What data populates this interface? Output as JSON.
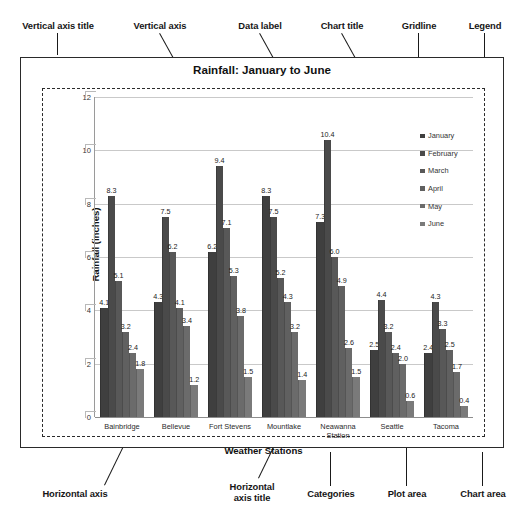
{
  "annotations": {
    "top": [
      {
        "label": "Vertical axis title",
        "x": 4,
        "y": 20,
        "w": 108,
        "leader": {
          "x": 58,
          "y": 33,
          "len": 22,
          "rot": 90
        }
      },
      {
        "label": "Vertical axis",
        "x": 118,
        "y": 20,
        "w": 84,
        "leader": {
          "x": 160,
          "y": 33,
          "len": 92,
          "rot": 61
        }
      },
      {
        "label": "Data label",
        "x": 224,
        "y": 20,
        "w": 72,
        "leader": {
          "x": 260,
          "y": 33,
          "len": 150,
          "rot": 61
        }
      },
      {
        "label": "Chart title",
        "x": 306,
        "y": 20,
        "w": 72,
        "leader": {
          "x": 342,
          "y": 33,
          "len": 46,
          "rot": 61
        }
      },
      {
        "label": "Gridline",
        "x": 388,
        "y": 20,
        "w": 62,
        "leader": {
          "x": 419,
          "y": 33,
          "len": 79,
          "rot": 90
        }
      },
      {
        "label": "Legend",
        "x": 454,
        "y": 20,
        "w": 62,
        "leader": {
          "x": 485,
          "y": 33,
          "len": 60,
          "rot": 90
        }
      }
    ],
    "bottom": [
      {
        "label": "Horizontal axis",
        "x": 20,
        "y": 488,
        "w": 110,
        "leader": {
          "x": 104,
          "y": 485,
          "len": 108,
          "rot": -64
        }
      },
      {
        "label": "Horizontal\naxis title",
        "x": 212,
        "y": 481,
        "w": 80,
        "leader": {
          "x": 258,
          "y": 478,
          "len": 52,
          "rot": -64
        }
      },
      {
        "label": "Categories",
        "x": 296,
        "y": 488,
        "w": 70,
        "leader": {
          "x": 331,
          "y": 452,
          "len": 34,
          "rot": 90
        }
      },
      {
        "label": "Plot area",
        "x": 374,
        "y": 488,
        "w": 66,
        "leader": {
          "x": 407,
          "y": 441,
          "len": 45,
          "rot": 90
        }
      },
      {
        "label": "Chart area",
        "x": 448,
        "y": 488,
        "w": 70,
        "leader": {
          "x": 483,
          "y": 452,
          "len": 34,
          "rot": 90
        }
      }
    ]
  },
  "chart": {
    "title": "Rainfall: January to June",
    "y_axis_title": "Rainfall (inches)",
    "x_axis_title": "Weather Stations",
    "y_ticks": [
      "12",
      "10",
      "8",
      "6",
      "4",
      "2",
      "0"
    ]
  },
  "legend": {
    "items": [
      {
        "label": "January",
        "color": "#3f3f3f"
      },
      {
        "label": "February",
        "color": "#4a4a4a"
      },
      {
        "label": "March",
        "color": "#585858"
      },
      {
        "label": "April",
        "color": "#606060"
      },
      {
        "label": "May",
        "color": "#6b6b6b"
      },
      {
        "label": "June",
        "color": "#7a7a7a"
      }
    ]
  },
  "chart_data": {
    "type": "bar",
    "title": "Rainfall: January to June",
    "xlabel": "Weather Stations",
    "ylabel": "Rainfall (inches)",
    "ylim": [
      0,
      12
    ],
    "yticks": [
      0,
      2,
      4,
      6,
      8,
      10,
      12
    ],
    "grid": true,
    "legend_position": "right",
    "categories": [
      "Bainbridge",
      "Bellevue",
      "Fort Stevens",
      "Mountlake",
      "Neawanna Station",
      "Seattle",
      "Tacoma"
    ],
    "series": [
      {
        "name": "January",
        "color": "#3f3f3f",
        "values": [
          4.1,
          4.3,
          6.2,
          8.3,
          7.3,
          2.5,
          2.4
        ]
      },
      {
        "name": "February",
        "color": "#4a4a4a",
        "values": [
          8.3,
          7.5,
          9.4,
          7.5,
          10.4,
          4.4,
          4.3
        ]
      },
      {
        "name": "March",
        "color": "#585858",
        "values": [
          5.1,
          6.2,
          7.1,
          5.2,
          6.0,
          3.2,
          3.3
        ]
      },
      {
        "name": "April",
        "color": "#606060",
        "values": [
          3.2,
          4.1,
          5.3,
          4.3,
          4.9,
          2.4,
          2.5
        ]
      },
      {
        "name": "May",
        "color": "#6b6b6b",
        "values": [
          2.4,
          3.4,
          3.8,
          3.2,
          2.6,
          2.0,
          1.7
        ]
      },
      {
        "name": "June",
        "color": "#7a7a7a",
        "values": [
          1.8,
          1.2,
          1.5,
          1.4,
          1.5,
          0.6,
          0.4
        ]
      }
    ]
  }
}
